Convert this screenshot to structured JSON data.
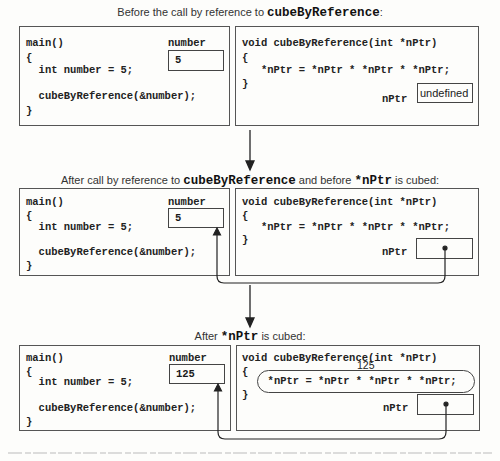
{
  "stages": [
    {
      "title_prefix": "Before the call by reference to ",
      "title_code": "cubeByReference",
      "title_suffix": ":",
      "main_lines": [
        "main()",
        "{",
        "  int number = 5;",
        "",
        "  cubeByReference(&number);",
        "}"
      ],
      "main_var_label": "number",
      "main_var_value": "5",
      "func_lines": [
        "void cubeByReference(int *nPtr)",
        "{",
        "   *nPtr = *nPtr * *nPtr * *nPtr;",
        "}"
      ],
      "func_var_label": "nPtr",
      "func_var_value": "undefined"
    },
    {
      "title_prefix": "After call by reference to ",
      "title_code": "cubeByReference",
      "title_mid": " and before ",
      "title_code2": "*nPtr",
      "title_suffix": " is cubed:",
      "main_lines": [
        "main()",
        "{",
        "  int number = 5;",
        "",
        "  cubeByReference(&number);",
        "}"
      ],
      "main_var_label": "number",
      "main_var_value": "5",
      "func_lines": [
        "void cubeByReference(int *nPtr)",
        "{",
        "   *nPtr = *nPtr * *nPtr * *nPtr;",
        "}"
      ],
      "func_var_label": "nPtr",
      "func_var_value": "pointer to number"
    },
    {
      "title_prefix": "After ",
      "title_code": "*nPtr",
      "title_suffix": " is cubed:",
      "main_lines": [
        "main()",
        "{",
        "  int number = 5;",
        "",
        "  cubeByReference(&number);",
        "}"
      ],
      "main_var_label": "number",
      "main_var_value": "125",
      "func_lines": [
        "void cubeByReference(int *nPtr)",
        "{",
        "  *nPtr = *nPtr * *nPtr * *nPtr;",
        "}"
      ],
      "func_annotation": "125",
      "func_var_label": "nPtr",
      "func_var_value": "pointer to number"
    }
  ]
}
